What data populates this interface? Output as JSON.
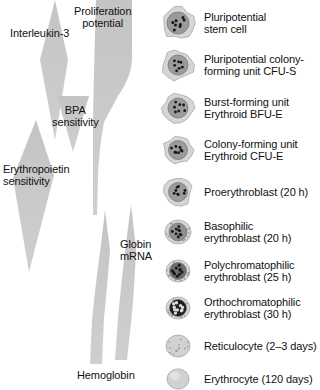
{
  "figure": {
    "background_color": "#ffffff",
    "wedge_color": "#c8c8c8",
    "text_color": "#111111"
  },
  "factors": [
    {
      "id": "interleukin-3",
      "label": "Interleukin-3",
      "shape": "diamond",
      "meaning": "sensitivity range",
      "span_top": 0,
      "span_bottom": 140
    },
    {
      "id": "proliferation-potential",
      "label": "Proliferation\npotential",
      "shape": "tapering-bar",
      "meaning": "decreases downward",
      "span_top": 0,
      "span_bottom": 215
    },
    {
      "id": "bpa-sensitivity",
      "label": "BPA\nsensitivity",
      "shape": "inverted-triangle",
      "meaning": "burst promoting activity sensitivity",
      "span_top": 96,
      "span_bottom": 152
    },
    {
      "id": "erythropoietin-sensitivity",
      "label": "Erythropoietin\nsensitivity",
      "shape": "diamond",
      "meaning": "sensitivity range",
      "span_top": 120,
      "span_bottom": 272
    },
    {
      "id": "globin-mrna",
      "label": "Globin\nmRNA",
      "shape": "widening-wedge",
      "meaning": "increases downward",
      "span_top": 205,
      "span_bottom": 360
    },
    {
      "id": "hemoglobin",
      "label": "Hemoglobin",
      "shape": "widening-wedge",
      "meaning": "increases downward",
      "span_top": 210,
      "span_bottom": 365
    }
  ],
  "cells": [
    {
      "id": "pluripotential-stem-cell",
      "label": "Pluripotential\nstem cell",
      "top": 4,
      "cell_r": 16,
      "nucleus_r": 11,
      "nucleus_fill": "#9b9b9b",
      "granule_count": 8,
      "granule_r": 1.5,
      "irregular": true,
      "speckled_cytoplasm": false
    },
    {
      "id": "cfu-s",
      "label": "Pluripotential colony-\nforming unit CFU-S",
      "top": 46,
      "cell_r": 15,
      "nucleus_r": 10,
      "nucleus_fill": "#9b9b9b",
      "granule_count": 7,
      "granule_r": 1.4,
      "irregular": true,
      "speckled_cytoplasm": false
    },
    {
      "id": "bfu-e",
      "label": "Burst-forming unit\nErythroid BFU-E",
      "top": 89,
      "cell_r": 15,
      "nucleus_r": 10,
      "nucleus_fill": "#9b9b9b",
      "granule_count": 7,
      "granule_r": 1.4,
      "irregular": true,
      "speckled_cytoplasm": false
    },
    {
      "id": "cfu-e",
      "label": "Colony-forming unit\nErythroid CFU-E",
      "top": 131,
      "cell_r": 14,
      "nucleus_r": 9.5,
      "nucleus_fill": "#9b9b9b",
      "granule_count": 8,
      "granule_r": 1.4,
      "irregular": true,
      "speckled_cytoplasm": false
    },
    {
      "id": "proerythroblast",
      "label": "Proerythroblast (20 h)",
      "top": 173,
      "cell_r": 14,
      "nucleus_r": 9.5,
      "nucleus_fill": "#9b9b9b",
      "granule_count": 8,
      "granule_r": 1.4,
      "irregular": true,
      "speckled_cytoplasm": false
    },
    {
      "id": "basophilic-erythroblast",
      "label": "Basophilic\nerythroblast (20 h)",
      "top": 213,
      "cell_r": 13,
      "nucleus_r": 9,
      "nucleus_fill": "#8f8f8f",
      "granule_count": 9,
      "granule_r": 1.4,
      "irregular": false,
      "speckled_cytoplasm": true
    },
    {
      "id": "polychromatophilic-erythroblast",
      "label": "Polychromatophilic\nerythroblast (25 h)",
      "top": 252,
      "cell_r": 12,
      "nucleus_r": 8.5,
      "nucleus_fill": "#6e6e6e",
      "granule_count": 10,
      "granule_r": 1.5,
      "irregular": false,
      "speckled_cytoplasm": true
    },
    {
      "id": "orthochromatophilic-erythroblast",
      "label": "Orthochromatophilic\nerythroblast (30 h)",
      "top": 289,
      "cell_r": 12,
      "nucleus_r": 8.5,
      "nucleus_fill": "#1c1c1c",
      "granule_count": 10,
      "granule_r": 1.7,
      "irregular": false,
      "speckled_cytoplasm": true
    },
    {
      "id": "reticulocyte",
      "label": "Reticulocyte (2–3 days)",
      "top": 327,
      "cell_r": 12,
      "nucleus_r": 0,
      "nucleus_fill": "none",
      "granule_count": 14,
      "granule_r": 0.9,
      "irregular": false,
      "speckled_cytoplasm": true
    },
    {
      "id": "erythrocyte",
      "label": "Erythrocyte (120 days)",
      "top": 360,
      "cell_r": 11,
      "nucleus_r": 0,
      "nucleus_fill": "none",
      "granule_count": 0,
      "granule_r": 0,
      "irregular": false,
      "speckled_cytoplasm": false
    }
  ]
}
